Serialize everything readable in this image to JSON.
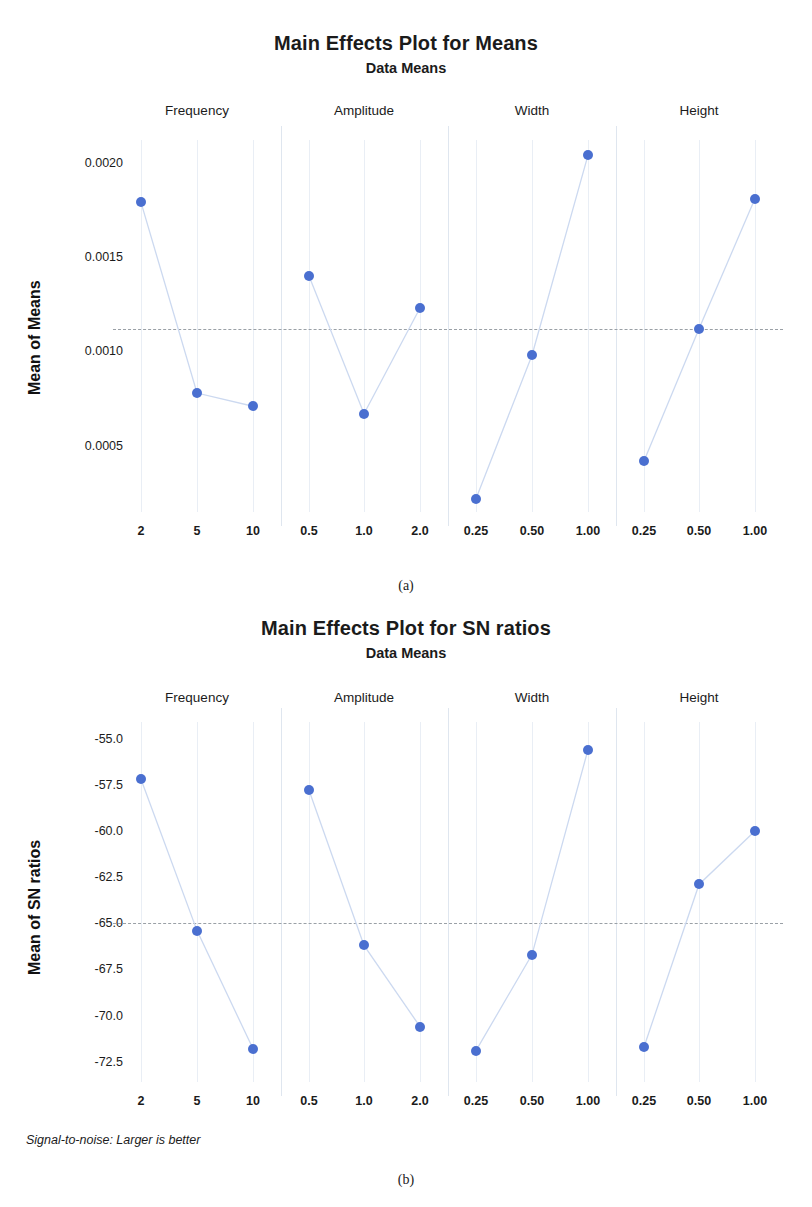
{
  "figure": {
    "caption_a": "(a)",
    "caption_b": "(b)"
  },
  "chart_data": [
    {
      "id": "means",
      "type": "line",
      "title": "Main Effects Plot for Means",
      "subtitle": "Data Means",
      "ylabel": "Mean of Means",
      "xlabel": "",
      "ylim": [
        0.00015,
        0.00212
      ],
      "yticks": [
        0.002,
        0.0015,
        0.001,
        0.0005
      ],
      "ytick_labels": [
        "0.0020",
        "0.0015",
        "0.0010",
        "0.0005"
      ],
      "reference_line": 0.00112,
      "grid": false,
      "legend": "none",
      "factors": [
        {
          "name": "Frequency",
          "categories": [
            "2",
            "5",
            "10"
          ],
          "values": [
            0.00179,
            0.00078,
            0.00071
          ]
        },
        {
          "name": "Amplitude",
          "categories": [
            "0.5",
            "1.0",
            "2.0"
          ],
          "values": [
            0.0014,
            0.00067,
            0.00123
          ]
        },
        {
          "name": "Width",
          "categories": [
            "0.25",
            "0.50",
            "1.00"
          ],
          "values": [
            0.00022,
            0.00098,
            0.00204
          ]
        },
        {
          "name": "Height",
          "categories": [
            "0.25",
            "0.50",
            "1.00"
          ],
          "values": [
            0.00042,
            0.00112,
            0.00181
          ]
        }
      ],
      "footnote": ""
    },
    {
      "id": "sn-ratios",
      "type": "line",
      "title": "Main Effects Plot for SN ratios",
      "subtitle": "Data Means",
      "ylabel": "Mean of SN ratios",
      "xlabel": "",
      "ylim": [
        -73.6,
        -54.1
      ],
      "yticks": [
        -55.0,
        -57.5,
        -60.0,
        -62.5,
        -65.0,
        -67.5,
        -70.0,
        -72.5
      ],
      "ytick_labels": [
        "-55.0",
        "-57.5",
        "-60.0",
        "-62.5",
        "-65.0",
        "-67.5",
        "-70.0",
        "-72.5"
      ],
      "reference_line": -65.0,
      "grid": false,
      "legend": "none",
      "factors": [
        {
          "name": "Frequency",
          "categories": [
            "2",
            "5",
            "10"
          ],
          "values": [
            -57.2,
            -65.4,
            -71.8
          ]
        },
        {
          "name": "Amplitude",
          "categories": [
            "0.5",
            "1.0",
            "2.0"
          ],
          "values": [
            -57.8,
            -66.2,
            -70.6
          ]
        },
        {
          "name": "Width",
          "categories": [
            "0.25",
            "0.50",
            "1.00"
          ],
          "values": [
            -71.9,
            -66.7,
            -55.6
          ]
        },
        {
          "name": "Height",
          "categories": [
            "0.25",
            "0.50",
            "1.00"
          ],
          "values": [
            -71.7,
            -62.9,
            -60.0
          ]
        }
      ],
      "footnote": "Signal-to-noise: Larger is better"
    }
  ],
  "colors": {
    "marker": "#4a6fd0",
    "line": "#ccd9f0",
    "reference": "#9aa0a6",
    "separator": "#dfe6ef",
    "text": "#1b1b1b"
  }
}
